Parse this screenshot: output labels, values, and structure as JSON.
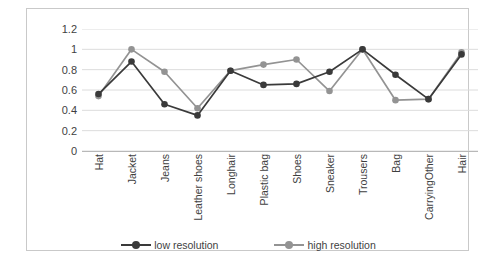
{
  "chart_data": {
    "type": "line",
    "title": "",
    "xlabel": "",
    "ylabel": "",
    "ylim": [
      0,
      1.2
    ],
    "ytick_step": 0.2,
    "grid": true,
    "legend_position": "bottom",
    "categories": [
      "Hat",
      "Jacket",
      "Jeans",
      "Leather shoes",
      "Longhair",
      "Plastic bag",
      "Shoes",
      "Sneaker",
      "Trousers",
      "Bag",
      "CarryingOther",
      "Hair"
    ],
    "ytick_labels": [
      "1.2",
      "1",
      "0.8",
      "0.6",
      "0.4",
      "0.2",
      "0"
    ],
    "ytick_values": [
      1.2,
      1,
      0.8,
      0.6,
      0.4,
      0.2,
      0
    ],
    "series": [
      {
        "name": "low resolution",
        "color": "#3a3a3a",
        "marker": "circle",
        "values": [
          0.56,
          0.88,
          0.46,
          0.35,
          0.79,
          0.65,
          0.66,
          0.78,
          1.0,
          0.75,
          0.51,
          0.95
        ]
      },
      {
        "name": "high resolution",
        "color": "#939393",
        "marker": "circle",
        "values": [
          0.54,
          1.0,
          0.78,
          0.42,
          0.79,
          0.85,
          0.9,
          0.59,
          1.0,
          0.5,
          0.51,
          0.97
        ]
      }
    ]
  },
  "legend": {
    "items": [
      {
        "label": "low resolution",
        "color": "#3a3a3a"
      },
      {
        "label": "high resolution",
        "color": "#939393"
      }
    ]
  },
  "colors": {
    "low_resolution": "#3a3a3a",
    "high_resolution": "#939393",
    "gridline": "#dcdcdc",
    "frame": "#c9c9c9",
    "text": "#3f3f3f",
    "background": "#ffffff"
  }
}
